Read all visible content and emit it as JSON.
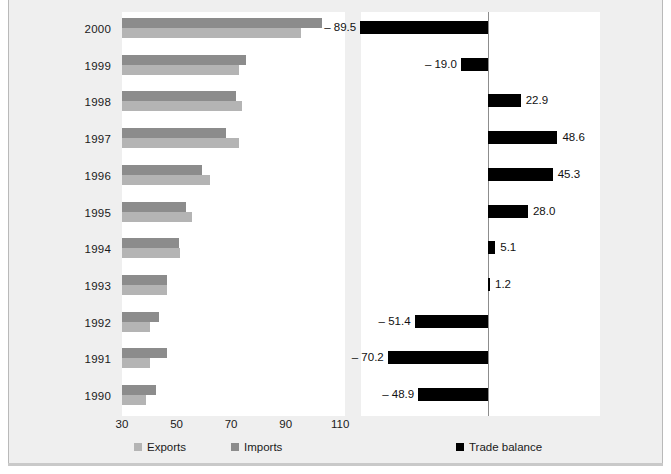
{
  "chart_data": {
    "type": "bar",
    "title": "",
    "subtitle": "",
    "xlabel": "",
    "ylabel": "",
    "orientation": "horizontal",
    "grid": false,
    "legend_position": "bottom",
    "categories": [
      "2000",
      "1999",
      "1998",
      "1997",
      "1996",
      "1995",
      "1994",
      "1993",
      "1992",
      "1991",
      "1990"
    ],
    "left_panel": {
      "xlim": [
        30,
        118
      ],
      "ticks": [
        30,
        50,
        70,
        90,
        110
      ],
      "series": [
        {
          "name": "Imports",
          "color": "#8c8c8c",
          "values": [
            103.3,
            75.5,
            71.8,
            68.3,
            59.2,
            53.3,
            50.8,
            46.4,
            43.6,
            46.4,
            42.6
          ]
        },
        {
          "name": "Exports",
          "color": "#b4b4b4",
          "values": [
            95.7,
            73.0,
            73.9,
            72.8,
            62.3,
            55.8,
            51.2,
            46.6,
            40.2,
            40.1,
            38.9
          ]
        }
      ]
    },
    "right_panel": {
      "series_name": "Trade balance",
      "color": "#000000",
      "zero_at": 0,
      "values": [
        -89.5,
        -19.0,
        22.9,
        48.6,
        45.3,
        28.0,
        5.1,
        1.2,
        -51.4,
        -70.2,
        -48.9
      ],
      "labels": [
        "– 89.5",
        "– 19.0",
        "22.9",
        "48.6",
        "45.3",
        "28.0",
        "5.1",
        "1.2",
        "– 51.4",
        "– 70.2",
        "– 48.9"
      ]
    },
    "legend": [
      {
        "label": "Exports",
        "color": "#b4b4b4"
      },
      {
        "label": "Imports",
        "color": "#8c8c8c"
      },
      {
        "label": "Trade balance",
        "color": "#000000"
      }
    ]
  },
  "axis": {
    "x_ticks": [
      "30",
      "50",
      "70",
      "90",
      "110"
    ]
  }
}
